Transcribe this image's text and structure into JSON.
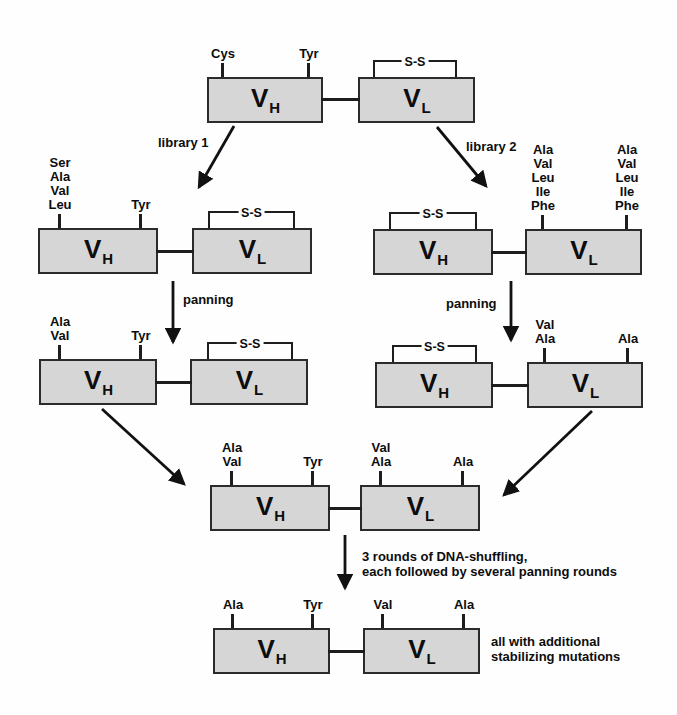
{
  "figure_type": "antibody scFv library engineering flow diagram",
  "colors": {
    "background": "#fefefe",
    "box_fill": "#d6d6d6",
    "box_border": "#2b2b2b",
    "line": "#1d1d1d",
    "text": "#0d0d0d"
  },
  "domain_labels": {
    "vh_main": "V",
    "vh_sub": "H",
    "vl_main": "V",
    "vl_sub": "L"
  },
  "bridge_label": "S-S",
  "units": {
    "top": {
      "vh_ticks": {
        "t1": [
          "Cys"
        ],
        "t2": [
          "Tyr"
        ]
      }
    },
    "lib1": {
      "vh_ticks": {
        "t1": [
          "Ser",
          "Ala",
          "Val",
          "Leu"
        ],
        "t2": [
          "Tyr"
        ]
      }
    },
    "lib2": {
      "vl_ticks": {
        "t1": [
          "Ala",
          "Val",
          "Leu",
          "Ile",
          "Phe"
        ],
        "t2": [
          "Ala",
          "Val",
          "Leu",
          "Ile",
          "Phe"
        ]
      }
    },
    "pan1": {
      "vh_ticks": {
        "t1": [
          "Ala",
          "Val"
        ],
        "t2": [
          "Tyr"
        ]
      }
    },
    "pan2": {
      "vl_ticks": {
        "t1": [
          "Val",
          "Ala"
        ],
        "t2": [
          "Ala"
        ]
      }
    },
    "merged": {
      "vh_ticks": {
        "t1": [
          "Ala",
          "Val"
        ],
        "t2": [
          "Tyr"
        ]
      },
      "vl_ticks": {
        "t1": [
          "Val",
          "Ala"
        ],
        "t2": [
          "Ala"
        ]
      }
    },
    "final": {
      "vh_ticks": {
        "t1": [
          "Ala"
        ],
        "t2": [
          "Tyr"
        ]
      },
      "vl_ticks": {
        "t1": [
          "Val"
        ],
        "t2": [
          "Ala"
        ]
      }
    }
  },
  "annotations": {
    "library1": "library 1",
    "library2": "library 2",
    "panning_left": "panning",
    "panning_right": "panning",
    "shuffling_line1": "3 rounds of DNA-shuffling,",
    "shuffling_line2": "each followed by several panning rounds",
    "note_line1": "all with additional",
    "note_line2": "stabilizing mutations"
  }
}
